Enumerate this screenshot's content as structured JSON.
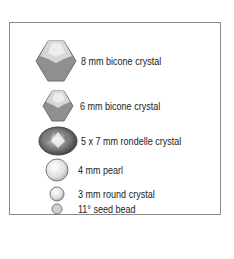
{
  "legend": {
    "items": [
      {
        "label": "8 mm bicone crystal",
        "icon": "bicone-crystal-large-icon"
      },
      {
        "label": "6 mm bicone crystal",
        "icon": "bicone-crystal-small-icon"
      },
      {
        "label": "5 x 7 mm rondelle crystal",
        "icon": "rondelle-crystal-icon"
      },
      {
        "label": "4 mm pearl",
        "icon": "pearl-icon"
      },
      {
        "label": "3 mm round crystal",
        "icon": "round-crystal-icon"
      },
      {
        "label": "11° seed bead",
        "icon": "seed-bead-icon"
      }
    ]
  },
  "colors": {
    "bicone_dark": "#8a8a8a",
    "bicone_light": "#d4d4d4",
    "border": "#8a8a8a"
  }
}
